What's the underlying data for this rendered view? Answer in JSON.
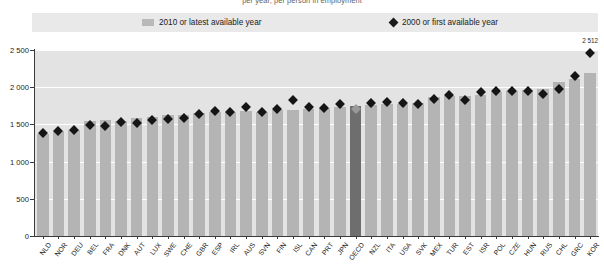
{
  "chart_data": {
    "type": "bar",
    "title": "per year, per person in employment",
    "xlabel": "",
    "ylabel": "",
    "ylim": [
      0,
      2500
    ],
    "yticks": [
      0,
      500,
      1000,
      1500,
      2000,
      2500
    ],
    "ytick_labels": [
      "0",
      "500",
      "1 000",
      "1 500",
      "2 000",
      "2 500"
    ],
    "grid": true,
    "legend_position": "top",
    "categories": [
      "NLD",
      "NOR",
      "DEU",
      "BEL",
      "FRA",
      "DNK",
      "AUT",
      "LUX",
      "SWE",
      "CHE",
      "GBR",
      "ESP",
      "IRL",
      "AUS",
      "SVN",
      "FIN",
      "ISL",
      "CAN",
      "PRT",
      "JPN",
      "OECD",
      "NZL",
      "ITA",
      "USA",
      "SVK",
      "MEX",
      "TUR",
      "EST",
      "ISR",
      "POL",
      "CZE",
      "HUN",
      "RUS",
      "CHL",
      "GRC",
      "KOR"
    ],
    "series": [
      {
        "name": "2010 or latest available year",
        "marker": "bar",
        "color": "#b4b4b4",
        "highlight_color": "#6e6e6e",
        "highlight_category": "OECD",
        "values": [
          1377,
          1414,
          1419,
          1551,
          1554,
          1546,
          1587,
          1601,
          1624,
          1632,
          1647,
          1663,
          1664,
          1686,
          1664,
          1697,
          1697,
          1702,
          1714,
          1733,
          1749,
          1758,
          1778,
          1778,
          1786,
          1866,
          1877,
          1879,
          1889,
          1939,
          1947,
          1961,
          1976,
          2068,
          2109,
          2193
        ]
      },
      {
        "name": "2000 or first available year",
        "marker": "diamond",
        "color": "#151515",
        "highlight_color": "#9a9a9a",
        "highlight_category": "OECD",
        "values": [
          1435,
          1455,
          1471,
          1535,
          1531,
          1579,
          1567,
          1601,
          1625,
          1637,
          1691,
          1731,
          1719,
          1777,
          1711,
          1751,
          1876,
          1779,
          1773,
          1821,
          1752,
          1837,
          1843,
          1834,
          1816,
          1886,
          1937,
          1869,
          1982,
          1990,
          1997,
          1997,
          1959,
          2023,
          2199,
          2512
        ]
      }
    ],
    "data_labels": [
      {
        "category": "KOR",
        "series": "2000 or first available year",
        "text": "2 512"
      }
    ]
  },
  "legend": {
    "items": [
      {
        "label": "2010 or latest available year",
        "swatch": "bar-swatch"
      },
      {
        "label": "2000 or first available year",
        "swatch": "diamond-swatch"
      }
    ]
  }
}
